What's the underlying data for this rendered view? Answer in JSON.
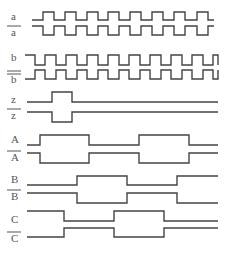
{
  "diagram": {
    "type": "timing-diagram",
    "signals": [
      {
        "id": "a",
        "label": "a",
        "inverted": false,
        "double_bar": false,
        "label_y": 20,
        "high_y": 12,
        "low_y": 20,
        "x_start": 32,
        "x_end": 214,
        "initial": 0,
        "transitions": [
          43,
          54,
          65,
          76,
          87,
          98,
          108,
          119,
          130,
          141,
          152,
          163,
          174,
          185,
          197,
          208
        ]
      },
      {
        "id": "a_bar",
        "label": "a",
        "inverted": true,
        "double_bar": false,
        "label_y": 36,
        "high_y": 26,
        "low_y": 35,
        "x_start": 32,
        "x_end": 214,
        "initial": 1,
        "transitions": [
          43,
          54,
          65,
          76,
          87,
          98,
          108,
          119,
          130,
          141,
          152,
          163,
          174,
          185,
          197,
          208
        ]
      },
      {
        "id": "b",
        "label": "b",
        "inverted": false,
        "double_bar": false,
        "label_y": 61,
        "high_y": 55,
        "low_y": 65,
        "x_start": 25,
        "x_end": 218,
        "initial": 1,
        "transitions": [
          35,
          45,
          56,
          66,
          77,
          87,
          98,
          108,
          119,
          129,
          140,
          150,
          161,
          171,
          182,
          192,
          203,
          213,
          218
        ]
      },
      {
        "id": "b_bar",
        "label": "b",
        "inverted": true,
        "double_bar": true,
        "label_y": 83,
        "high_y": 70,
        "low_y": 79,
        "x_start": 25,
        "x_end": 218,
        "initial": 0,
        "transitions": [
          35,
          45,
          56,
          66,
          77,
          87,
          98,
          108,
          119,
          129,
          140,
          150,
          161,
          171,
          182,
          192,
          203,
          213,
          218
        ]
      },
      {
        "id": "z",
        "label": "z",
        "inverted": false,
        "double_bar": false,
        "label_y": 103,
        "high_y": 92,
        "low_y": 102,
        "x_start": 27,
        "x_end": 218,
        "initial": 0,
        "transitions": [
          52,
          72
        ]
      },
      {
        "id": "z_bar",
        "label": "z",
        "inverted": true,
        "double_bar": false,
        "label_y": 119,
        "high_y": 112,
        "low_y": 122,
        "x_start": 27,
        "x_end": 218,
        "initial": 1,
        "transitions": [
          52,
          72
        ]
      },
      {
        "id": "A",
        "label": "A",
        "inverted": false,
        "double_bar": false,
        "label_y": 143,
        "high_y": 135,
        "low_y": 145,
        "x_start": 27,
        "x_end": 218,
        "initial": 0,
        "transitions": [
          40,
          89,
          139,
          189
        ]
      },
      {
        "id": "A_bar",
        "label": "A",
        "inverted": true,
        "double_bar": false,
        "label_y": 161,
        "high_y": 153,
        "low_y": 163,
        "x_start": 27,
        "x_end": 218,
        "initial": 1,
        "transitions": [
          40,
          89,
          139,
          189
        ]
      },
      {
        "id": "B",
        "label": "B",
        "inverted": false,
        "double_bar": false,
        "label_y": 183,
        "high_y": 176,
        "low_y": 185,
        "x_start": 27,
        "x_end": 218,
        "initial": 0,
        "transitions": [
          77,
          127,
          177
        ]
      },
      {
        "id": "B_bar",
        "label": "B",
        "inverted": true,
        "double_bar": false,
        "label_y": 200,
        "high_y": 193,
        "low_y": 203,
        "x_start": 27,
        "x_end": 218,
        "initial": 1,
        "transitions": [
          77,
          127,
          177
        ]
      },
      {
        "id": "C",
        "label": "C",
        "inverted": false,
        "double_bar": false,
        "label_y": 223,
        "high_y": 211,
        "low_y": 221,
        "x_start": 27,
        "x_end": 218,
        "initial": 1,
        "transitions": [
          64,
          114,
          164
        ]
      },
      {
        "id": "C_bar",
        "label": "C",
        "inverted": true,
        "double_bar": false,
        "label_y": 242,
        "high_y": 228,
        "low_y": 237,
        "x_start": 27,
        "x_end": 218,
        "initial": 0,
        "transitions": [
          64,
          114,
          164
        ]
      }
    ],
    "colors": {
      "line": "#444444",
      "label": "#555555",
      "background": "#ffffff"
    }
  }
}
